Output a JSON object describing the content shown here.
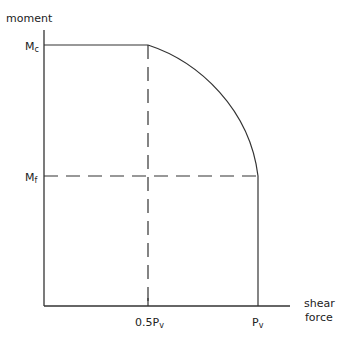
{
  "diagram": {
    "type": "interaction curve",
    "y_axis_label": "moment",
    "x_axis_label_line1": "shear",
    "x_axis_label_line2": "force",
    "y_ticks": [
      {
        "main": "M",
        "sub": "c"
      },
      {
        "main": "M",
        "sub": "f"
      }
    ],
    "x_ticks": [
      {
        "main": "0.5P",
        "sub": "v"
      },
      {
        "main": "P",
        "sub": "v"
      }
    ],
    "colors": {
      "line": "#333333",
      "background": "#ffffff"
    }
  }
}
